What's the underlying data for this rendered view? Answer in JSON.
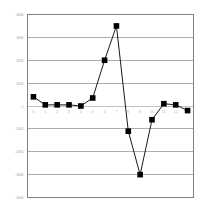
{
  "chart_data": {
    "type": "line",
    "title": "",
    "xlabel": "",
    "ylabel": "",
    "x": [
      0,
      1,
      2,
      3,
      4,
      5,
      6,
      7,
      8,
      9,
      10,
      11,
      12,
      13
    ],
    "categories": [
      "0",
      "1",
      "2",
      "3",
      "4",
      "5",
      "6",
      "7",
      "8",
      "9",
      "10",
      "11",
      "12",
      "13"
    ],
    "values": [
      40,
      5,
      5,
      5,
      0,
      35,
      200,
      350,
      -110,
      -300,
      -60,
      10,
      5,
      -20
    ],
    "series": [
      {
        "name": "series-1",
        "values": [
          40,
          5,
          5,
          5,
          0,
          35,
          200,
          350,
          -110,
          -300,
          -60,
          10,
          5,
          -20
        ]
      }
    ],
    "ylim": [
      -400,
      400
    ],
    "xlim": [
      -0.5,
      13.5
    ],
    "yticks": [
      400,
      300,
      200,
      100,
      0,
      -100,
      -200,
      -300,
      -400
    ],
    "ytick_labels": [
      "400",
      "300",
      "200",
      "100",
      "0",
      "-100",
      "-200",
      "-300",
      "-400"
    ],
    "grid": true,
    "grid_axis": "y",
    "legend": false,
    "legend_position": "none",
    "marker": "square",
    "marker_color": "#000000",
    "line_color": "#000000",
    "axis_color": "#808080",
    "grid_color": "#8c8c8c",
    "border_color": "#808080",
    "background": "#ffffff"
  },
  "axes": {
    "zero_line_label": "0"
  }
}
